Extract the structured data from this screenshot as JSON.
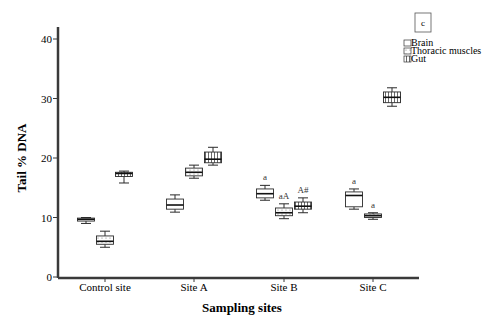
{
  "chart_data": {
    "type": "boxplot",
    "panel_label": "c",
    "xlabel": "Sampling sites",
    "ylabel": "Tail % DNA",
    "ylim": [
      0,
      40
    ],
    "yticks": [
      0,
      10,
      20,
      30,
      40
    ],
    "grid": false,
    "legend_position": "top-right",
    "categories": [
      "Control site",
      "Site A",
      "Site B",
      "Site C"
    ],
    "series": [
      {
        "name": "Brain",
        "pattern": "plain",
        "boxes": [
          {
            "category": "Control site",
            "whisker_low": 9.0,
            "q1": 9.4,
            "median": 9.7,
            "q3": 9.9,
            "whisker_high": 10.0,
            "annotation": ""
          },
          {
            "category": "Site A",
            "whisker_low": 10.9,
            "q1": 11.4,
            "median": 12.1,
            "q3": 13.1,
            "whisker_high": 13.8,
            "annotation": ""
          },
          {
            "category": "Site B",
            "whisker_low": 12.9,
            "q1": 13.3,
            "median": 14.0,
            "q3": 14.8,
            "whisker_high": 15.4,
            "annotation": "a"
          },
          {
            "category": "Site C",
            "whisker_low": 11.4,
            "q1": 11.8,
            "median": 13.7,
            "q3": 14.3,
            "whisker_high": 14.8,
            "annotation": "a"
          }
        ]
      },
      {
        "name": "Thoracic muscles",
        "pattern": "dotted",
        "boxes": [
          {
            "category": "Control site",
            "whisker_low": 5.0,
            "q1": 5.5,
            "median": 6.0,
            "q3": 6.9,
            "whisker_high": 7.7,
            "annotation": ""
          },
          {
            "category": "Site A",
            "whisker_low": 16.6,
            "q1": 17.0,
            "median": 17.6,
            "q3": 18.3,
            "whisker_high": 18.8,
            "annotation": ""
          },
          {
            "category": "Site B",
            "whisker_low": 9.8,
            "q1": 10.3,
            "median": 10.8,
            "q3": 11.6,
            "whisker_high": 12.3,
            "annotation": "aA"
          },
          {
            "category": "Site C",
            "whisker_low": 9.7,
            "q1": 10.0,
            "median": 10.3,
            "q3": 10.6,
            "whisker_high": 10.8,
            "annotation": "a"
          }
        ]
      },
      {
        "name": "Gut",
        "pattern": "vertical-hatch",
        "boxes": [
          {
            "category": "Control site",
            "whisker_low": 15.8,
            "q1": 16.9,
            "median": 17.4,
            "q3": 17.6,
            "whisker_high": 17.8,
            "annotation": ""
          },
          {
            "category": "Site A",
            "whisker_low": 18.8,
            "q1": 19.2,
            "median": 19.8,
            "q3": 21.0,
            "whisker_high": 21.8,
            "annotation": ""
          },
          {
            "category": "Site B",
            "whisker_low": 10.8,
            "q1": 11.4,
            "median": 11.9,
            "q3": 12.6,
            "whisker_high": 13.3,
            "annotation": "A#"
          },
          {
            "category": "Site C",
            "whisker_low": 28.7,
            "q1": 29.3,
            "median": 30.2,
            "q3": 31.1,
            "whisker_high": 31.8,
            "annotation": ""
          }
        ]
      }
    ]
  },
  "legend": {
    "items": [
      {
        "label": "Brain",
        "pattern": "plain"
      },
      {
        "label": "Thoracic muscles",
        "pattern": "dotted"
      },
      {
        "label": "Gut",
        "pattern": "vertical-hatch"
      }
    ]
  },
  "colors": {
    "axis": "#3a3a3a",
    "box_stroke": "#2a2a2a",
    "box_fill": "#ffffff",
    "text": "#1a1a1a"
  }
}
